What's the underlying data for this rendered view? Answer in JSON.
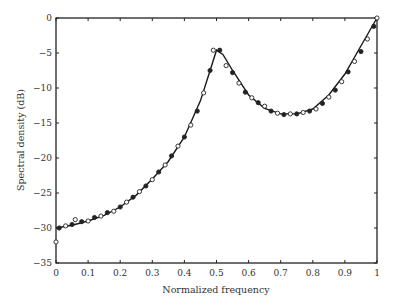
{
  "chart_data": {
    "type": "line",
    "title": "",
    "xlabel": "Normalized frequency",
    "ylabel": "Spectral density (dB)",
    "xlim": [
      0,
      1
    ],
    "ylim": [
      -35,
      0
    ],
    "xticks": [
      "0",
      "0.1",
      "0.2",
      "0.3",
      "0.4",
      "0.5",
      "0.6",
      "0.7",
      "0.8",
      "0.9",
      "1"
    ],
    "yticks": [
      "0",
      "-5",
      "-10",
      "-15",
      "-20",
      "-25",
      "-30",
      "-35"
    ],
    "grid": false,
    "legend": null,
    "series": [
      {
        "name": "model (solid line)",
        "style": "line",
        "x": [
          0,
          0.05,
          0.1,
          0.15,
          0.2,
          0.25,
          0.3,
          0.35,
          0.4,
          0.45,
          0.48,
          0.5,
          0.52,
          0.55,
          0.6,
          0.65,
          0.7,
          0.75,
          0.8,
          0.85,
          0.9,
          0.95,
          1.0
        ],
        "values": [
          -30,
          -29.6,
          -29,
          -28.2,
          -27,
          -25.3,
          -23,
          -20.5,
          -17,
          -11.8,
          -7.5,
          -4.6,
          -5.2,
          -7.5,
          -11,
          -12.9,
          -13.7,
          -13.7,
          -13,
          -11,
          -8,
          -4,
          0
        ]
      },
      {
        "name": "estimates (open/filled circles)",
        "style": "markers",
        "x": [
          0,
          0.01,
          0.03,
          0.05,
          0.06,
          0.08,
          0.1,
          0.12,
          0.14,
          0.16,
          0.18,
          0.2,
          0.22,
          0.24,
          0.26,
          0.28,
          0.3,
          0.32,
          0.34,
          0.36,
          0.38,
          0.4,
          0.42,
          0.44,
          0.46,
          0.48,
          0.49,
          0.51,
          0.53,
          0.55,
          0.57,
          0.59,
          0.61,
          0.63,
          0.65,
          0.67,
          0.69,
          0.71,
          0.73,
          0.75,
          0.77,
          0.79,
          0.81,
          0.83,
          0.85,
          0.87,
          0.89,
          0.91,
          0.93,
          0.95,
          0.97,
          0.99,
          1.0
        ],
        "values": [
          -32,
          -30,
          -29.7,
          -29.5,
          -28.8,
          -29.1,
          -29,
          -28.5,
          -28.3,
          -27.8,
          -27.6,
          -27,
          -26.3,
          -25.6,
          -24.8,
          -24,
          -23.1,
          -22,
          -21,
          -19.7,
          -18.3,
          -17,
          -15.3,
          -13.3,
          -10.7,
          -7.5,
          -4.6,
          -4.6,
          -6.8,
          -7.8,
          -9.3,
          -10.6,
          -11.4,
          -12.1,
          -12.6,
          -13.3,
          -13.6,
          -13.8,
          -13.7,
          -13.7,
          -13.5,
          -13.3,
          -13,
          -12.2,
          -11.3,
          -10.3,
          -9.1,
          -7.7,
          -6.2,
          -4.8,
          -3,
          -1.2,
          0
        ]
      }
    ]
  }
}
